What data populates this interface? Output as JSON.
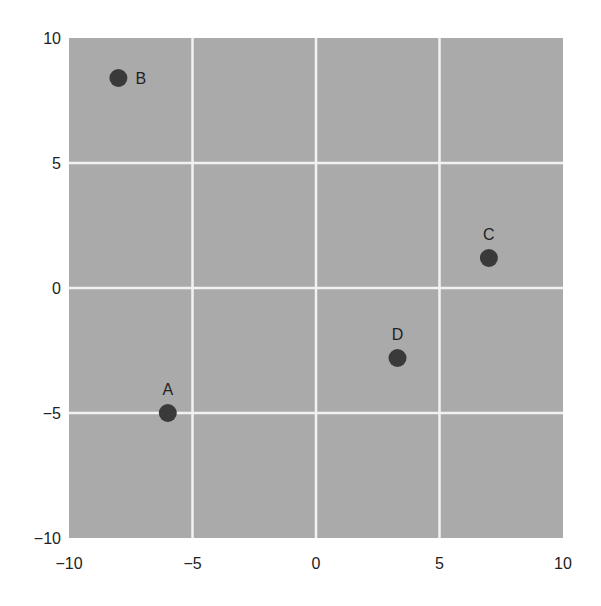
{
  "chart_data": {
    "type": "scatter",
    "title": "",
    "xlabel": "",
    "ylabel": "",
    "xlim": [
      -10,
      10
    ],
    "ylim": [
      -10,
      10
    ],
    "grid": true,
    "legend": null,
    "x_ticks": [
      -10,
      -5,
      0,
      5,
      10
    ],
    "y_ticks": [
      -10,
      -5,
      0,
      5,
      10
    ],
    "x_tick_labels": [
      "−10",
      "−5",
      "0",
      "5",
      "10"
    ],
    "y_tick_labels": [
      "−10",
      "−5",
      "0",
      "5",
      "10"
    ],
    "points": [
      {
        "label": "A",
        "x": -6,
        "y": -5,
        "label_position": "above"
      },
      {
        "label": "B",
        "x": -8,
        "y": 8.4,
        "label_position": "right"
      },
      {
        "label": "C",
        "x": 7,
        "y": 1.2,
        "label_position": "above"
      },
      {
        "label": "D",
        "x": 3.3,
        "y": -2.8,
        "label_position": "above"
      }
    ]
  },
  "colors": {
    "plot_background": "#aaaaaa",
    "grid": "#f2f2f2",
    "point": "#3a3a3a",
    "text": "#222222"
  },
  "layout": {
    "plot_left": 69,
    "plot_top": 38,
    "plot_right": 563,
    "plot_bottom": 538,
    "point_radius": 9
  }
}
